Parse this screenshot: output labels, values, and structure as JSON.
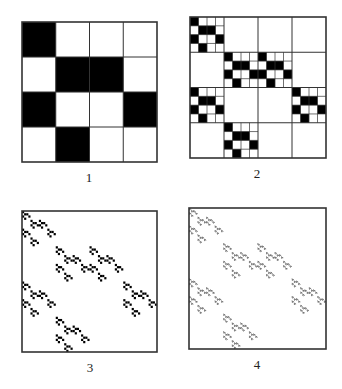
{
  "figure": {
    "base_pattern": [
      [
        1,
        0,
        0,
        0
      ],
      [
        0,
        1,
        1,
        0
      ],
      [
        1,
        0,
        0,
        1
      ],
      [
        0,
        1,
        0,
        0
      ]
    ],
    "colors": {
      "fill": "#000000",
      "background": "#ffffff",
      "grid": "#333333"
    },
    "panels": [
      {
        "label": "1",
        "iteration": 1,
        "grid_shown_levels": 1
      },
      {
        "label": "2",
        "iteration": 2,
        "grid_shown_levels": 2
      },
      {
        "label": "3",
        "iteration": 3,
        "grid_shown_levels": 0
      },
      {
        "label": "4",
        "iteration": 4,
        "grid_shown_levels": 0
      }
    ]
  }
}
